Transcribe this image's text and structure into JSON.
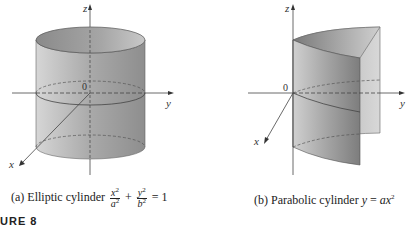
{
  "figure": {
    "label": "URE 8",
    "panels": [
      {
        "id": "a",
        "caption_prefix": "(a)  Elliptic cylinder",
        "equation": {
          "term1_num": "x",
          "term1_den": "a",
          "plus": "+",
          "term2_num": "y",
          "term2_den": "b",
          "exp": "2",
          "equals": "= 1"
        },
        "axes": {
          "z": "z",
          "y": "y",
          "x": "x",
          "origin": "0"
        }
      },
      {
        "id": "b",
        "caption_prefix": "(b)  Parabolic cylinder",
        "equation": {
          "lhs": "y",
          "equals": "=",
          "rhs_coef": "a",
          "rhs_var": "x",
          "exp": "2"
        },
        "axes": {
          "z": "z",
          "y": "y",
          "x": "x",
          "origin": "0"
        }
      }
    ]
  }
}
